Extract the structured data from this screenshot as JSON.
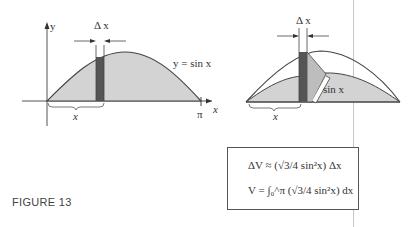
{
  "figure": {
    "caption": "FIGURE 13",
    "left_diagram": {
      "y_axis_label": "y",
      "x_axis_label": "x",
      "curve_label": "y = sin x",
      "delta_label": "Δ x",
      "brace_label": "x",
      "pi_label": "π"
    },
    "right_diagram": {
      "delta_label": "Δ x",
      "brace_label": "x",
      "side_label": "sin x"
    },
    "formulas": {
      "line1": "ΔV ≈ (√3/4 sin²x) Δx",
      "line2": "V = ∫₀^π (√3/4 sin²x) dx"
    },
    "colors": {
      "region_fill": "#d0d0d0",
      "slice_fill": "#555555",
      "curve": "#444444"
    }
  }
}
